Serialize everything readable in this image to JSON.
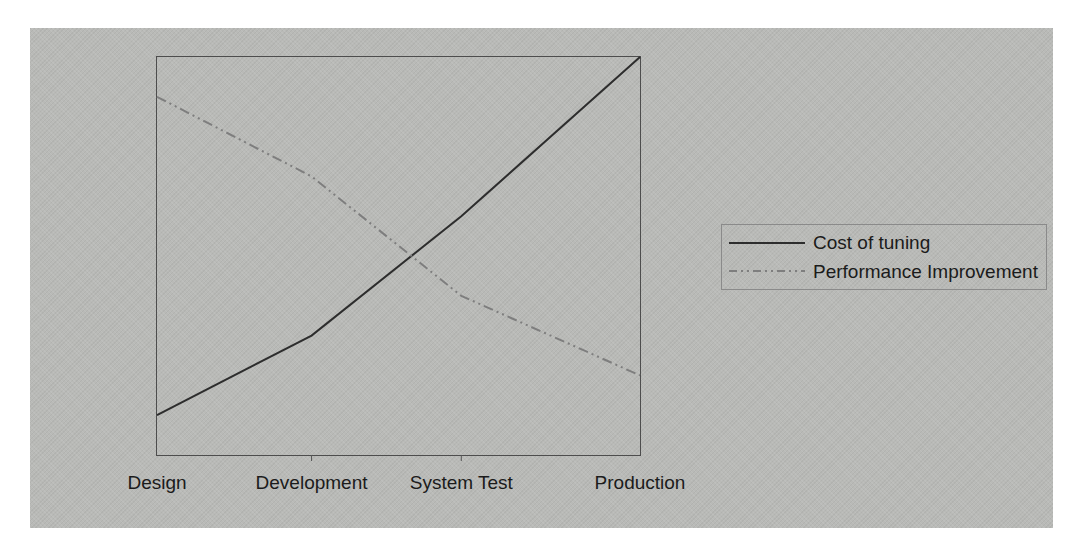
{
  "chart_data": {
    "type": "line",
    "categories": [
      "Design",
      "Development",
      "System Test",
      "Production"
    ],
    "series": [
      {
        "name": "Cost of tuning",
        "line_style": "solid",
        "color": "#2d2d2d",
        "values": [
          10,
          30,
          60,
          100
        ]
      },
      {
        "name": "Performance Improvement",
        "line_style": "dash-dot-dot",
        "color": "#7e7e7e",
        "values": [
          90,
          70,
          40,
          20
        ]
      }
    ],
    "title": "",
    "xlabel": "",
    "ylabel": "",
    "ylim": [
      0,
      100
    ],
    "y_axis_visible": false,
    "grid": false,
    "legend_position": "right-outside",
    "x_fractions": [
      0,
      0.32,
      0.63,
      1
    ]
  },
  "colors": {
    "page_background": "#ffffff",
    "scan_background": "#b9bab7",
    "plot_border": "#4d4d4d",
    "legend_border": "#8a8a8a",
    "tick": "#555555",
    "text": "#1b1b1b"
  }
}
